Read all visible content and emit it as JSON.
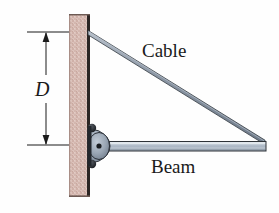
{
  "figure": {
    "width": 279,
    "height": 213,
    "background_color": "#fefefe"
  },
  "labels": {
    "cable": "Cable",
    "beam": "Beam",
    "dimension": "D"
  },
  "colors": {
    "wall_fill": "#d9bdb6",
    "wall_edge": "#2b2523",
    "beam_fill": "#b9c3cf",
    "beam_edge": "#2e3338",
    "cable_fill": "#8f9aa8",
    "cable_edge": "#313840",
    "pin_fill": "#9aa6b4",
    "pin_edge": "#2a2f36",
    "bolt_fill": "#1e2126",
    "dimension_line": "#1a1a1a",
    "text": "#1a1a1a"
  },
  "geometry": {
    "wall": {
      "x": 69,
      "y": 14,
      "width": 21,
      "height": 183
    },
    "beam": {
      "x1": 98,
      "y1": 146,
      "x2": 266,
      "y2": 146,
      "thickness": 9
    },
    "cable": {
      "x1": 88,
      "y1": 32,
      "x2": 265,
      "y2": 142,
      "thickness": 4
    },
    "pin": {
      "cx": 97,
      "cy": 146,
      "rx": 13,
      "ry": 16
    },
    "dimension": {
      "x": 46,
      "y_top": 32,
      "y_bottom": 145,
      "extension_line_x1": 27,
      "extension_line_x2": 69,
      "value_label": "D"
    }
  },
  "icon_names": {
    "pin_support": "pin-joint-icon",
    "upper_bolt": "bolt-icon",
    "lower_bolt": "bolt-icon",
    "arrow_up": "arrow-up-icon",
    "arrow_down": "arrow-down-icon"
  }
}
